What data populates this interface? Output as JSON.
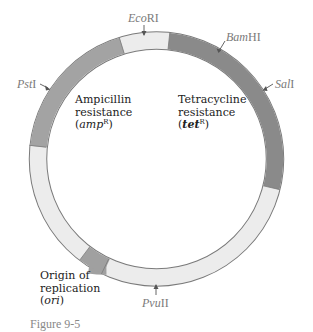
{
  "diagram": {
    "type": "plasmid-map",
    "colors": {
      "backbone": "#ececec",
      "amp": "#a3a3a3",
      "tet": "#8a8a8a",
      "ori": "#a0a0a0",
      "outline": "#7a7a7a"
    },
    "regions": [
      {
        "name": "amp",
        "label_lines": [
          "Ampicillin",
          "resistance"
        ],
        "gene": "amp",
        "superscript": "R"
      },
      {
        "name": "tet",
        "label_lines": [
          "Tetracycline",
          "resistance"
        ],
        "gene": "tet",
        "superscript": "R"
      },
      {
        "name": "ori",
        "label_lines": [
          "Origin of",
          "replication"
        ],
        "gene": "ori"
      }
    ],
    "sites": [
      {
        "name": "EcoRI",
        "italic": "Eco",
        "roman": "RI"
      },
      {
        "name": "BamHI",
        "italic": "Bam",
        "roman": "HI"
      },
      {
        "name": "SalI",
        "italic": "Sal",
        "roman": "I"
      },
      {
        "name": "PstI",
        "italic": "Pst",
        "roman": "I"
      },
      {
        "name": "PvuII",
        "italic": "Pvu",
        "roman": "II"
      }
    ]
  },
  "labels": {
    "amp_line1": "Ampicillin",
    "amp_line2": "resistance",
    "amp_gene": "amp",
    "amp_sup": "R",
    "tet_line1": "Tetracycline",
    "tet_line2": "resistance",
    "tet_gene": "tet",
    "tet_sup": "R",
    "ori_line1": "Origin of",
    "ori_line2": "replication",
    "ori_gene": "ori",
    "open_paren": "(",
    "close_paren": ")"
  },
  "sites": {
    "ecori_i": "Eco",
    "ecori_r": "RI",
    "bamhi_i": "Bam",
    "bamhi_r": "HI",
    "sali_i": "Sal",
    "sali_r": "I",
    "psti_i": "Pst",
    "psti_r": "I",
    "pvuii_i": "Pvu",
    "pvuii_r": "II"
  },
  "caption": "Figure 9-5"
}
